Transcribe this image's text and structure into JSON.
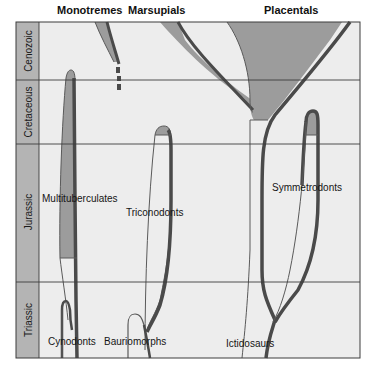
{
  "diagram": {
    "group_headers": [
      {
        "label": "Monotremes"
      },
      {
        "label": "Marsupials"
      },
      {
        "label": "Placentals"
      }
    ],
    "eras": [
      {
        "label": "Cenozoic"
      },
      {
        "label": "Cretaceous"
      },
      {
        "label": "Jurassic"
      },
      {
        "label": "Triassic"
      }
    ],
    "lineages": [
      {
        "label": "Multituberculates"
      },
      {
        "label": "Triconodonts"
      },
      {
        "label": "Symmetrodonts"
      },
      {
        "label": "Cynodonts"
      },
      {
        "label": "Bauriomorphs"
      },
      {
        "label": "Ictidosaurs"
      }
    ],
    "colors": {
      "background": "#ededed",
      "era_column": "#b4b4b4",
      "lineage_fill": "#9c9c9c",
      "lineage_stroke": "#4a4a4a",
      "thin_line": "#5a5a5a",
      "grid_line": "#3c3c3c"
    }
  }
}
